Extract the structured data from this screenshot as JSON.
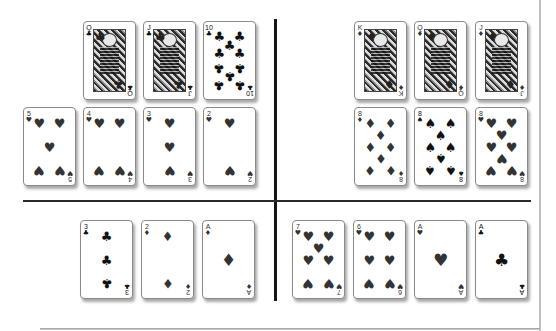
{
  "layout": {
    "divider_color": "#151515",
    "card_border": "#8a8a8a",
    "suit_color": "#333333"
  },
  "quadrants": {
    "top_left": {
      "face_row": [
        {
          "rank": "Q",
          "suit": "♣",
          "suit_name": "clubs",
          "x": 83,
          "y": 21
        },
        {
          "rank": "J",
          "suit": "♣",
          "suit_name": "clubs",
          "x": 143,
          "y": 21
        },
        {
          "rank": "10",
          "suit": "♣",
          "suit_name": "clubs",
          "x": 203,
          "y": 21
        }
      ],
      "low_row": [
        {
          "rank": "5",
          "suit": "♥",
          "suit_name": "hearts",
          "x": 23,
          "y": 107
        },
        {
          "rank": "4",
          "suit": "♥",
          "suit_name": "hearts",
          "x": 83,
          "y": 107
        },
        {
          "rank": "3",
          "suit": "♥",
          "suit_name": "hearts",
          "x": 143,
          "y": 107
        },
        {
          "rank": "2",
          "suit": "♥",
          "suit_name": "hearts",
          "x": 203,
          "y": 107
        }
      ]
    },
    "top_right": {
      "face_row": [
        {
          "rank": "K",
          "suit": "♦",
          "suit_name": "diamonds",
          "x": 354,
          "y": 21
        },
        {
          "rank": "Q",
          "suit": "♦",
          "suit_name": "diamonds",
          "x": 414,
          "y": 21
        },
        {
          "rank": "J",
          "suit": "♦",
          "suit_name": "diamonds",
          "x": 475,
          "y": 21
        }
      ],
      "low_row": [
        {
          "rank": "8",
          "suit": "♦",
          "suit_name": "diamonds",
          "x": 354,
          "y": 107
        },
        {
          "rank": "8",
          "suit": "♠",
          "suit_name": "spades",
          "x": 414,
          "y": 107
        },
        {
          "rank": "8",
          "suit": "♥",
          "suit_name": "hearts",
          "x": 475,
          "y": 107
        }
      ]
    },
    "bottom_left": {
      "cards": [
        {
          "rank": "3",
          "suit": "♣",
          "suit_name": "clubs",
          "x": 80,
          "y": 220
        },
        {
          "rank": "2",
          "suit": "♦",
          "suit_name": "diamonds",
          "x": 141,
          "y": 220
        },
        {
          "rank": "A",
          "suit": "♦",
          "suit_name": "diamonds",
          "x": 202,
          "y": 220
        }
      ]
    },
    "bottom_right": {
      "cards": [
        {
          "rank": "7",
          "suit": "♥",
          "suit_name": "hearts",
          "x": 292,
          "y": 220
        },
        {
          "rank": "6",
          "suit": "♥",
          "suit_name": "hearts",
          "x": 353,
          "y": 220
        },
        {
          "rank": "A",
          "suit": "♥",
          "suit_name": "hearts",
          "x": 414,
          "y": 220
        },
        {
          "rank": "A",
          "suit": "♣",
          "suit_name": "clubs",
          "x": 475,
          "y": 220
        }
      ]
    }
  }
}
